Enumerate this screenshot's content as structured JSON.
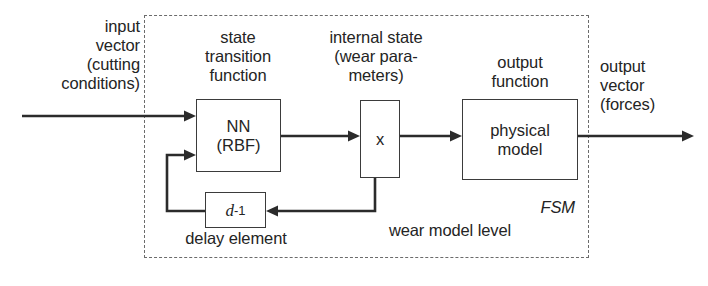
{
  "diagram": {
    "region": {
      "label_fsm": "FSM",
      "label_level": "wear model level",
      "border_color": "#6b6b6b",
      "border_style": "dashed"
    },
    "labels": {
      "input_vector": "input\nvector\n(cutting\nconditions)",
      "state_transition": "state\ntransition\nfunction",
      "internal_state": "internal state\n(wear para-\nmeters)",
      "output_function": "output\nfunction",
      "output_vector": "output\nvector\n(forces)",
      "delay_element": "delay element"
    },
    "boxes": {
      "nn": "NN\n(RBF)",
      "state_var": "x",
      "delay_d": "d",
      "delay_exp": "-1",
      "physical_model": "physical\nmodel"
    },
    "colors": {
      "stroke": "#2b2b2b",
      "box_border": "#3b3b3b",
      "text": "#242424",
      "background": "#ffffff"
    }
  }
}
